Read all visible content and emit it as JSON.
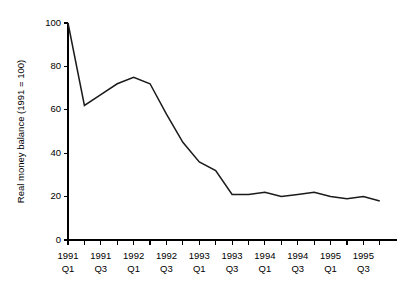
{
  "chart_data": {
    "type": "line",
    "title": "",
    "subtitle": "",
    "xlabel": "",
    "ylabel": "Real money balance (1991 = 100)",
    "ylim": [
      0,
      100
    ],
    "yticks": [
      0,
      20,
      40,
      60,
      80,
      100
    ],
    "ytick_labels": [
      "0",
      "20",
      "40",
      "60",
      "80",
      "100"
    ],
    "grid": false,
    "legend": false,
    "legend_position": "none",
    "line_color": "#1a1a1a",
    "axis_color": "#000000",
    "background_color": "#ffffff",
    "x_minor_ticks_every": 1,
    "x_label_every": 2,
    "categories": [
      "1991 Q1",
      "1991 Q2",
      "1991 Q3",
      "1991 Q4",
      "1992 Q1",
      "1992 Q2",
      "1992 Q3",
      "1992 Q4",
      "1993 Q1",
      "1993 Q2",
      "1993 Q3",
      "1993 Q4",
      "1994 Q1",
      "1994 Q2",
      "1994 Q3",
      "1994 Q4",
      "1995 Q1",
      "1995 Q2",
      "1995 Q3",
      "1995 Q4"
    ],
    "xtick_labels": [
      "1991\nQ1",
      "",
      "1991\nQ3",
      "",
      "1992\nQ1",
      "",
      "1992\nQ3",
      "",
      "1993\nQ1",
      "",
      "1993\nQ3",
      "",
      "1994\nQ1",
      "",
      "1994\nQ3",
      "",
      "1995\nQ1",
      "",
      "1995\nQ3",
      ""
    ],
    "xtick_labels_visible": [
      {
        "index": 0,
        "year": "1991",
        "quarter": "Q1"
      },
      {
        "index": 2,
        "year": "1991",
        "quarter": "Q3"
      },
      {
        "index": 4,
        "year": "1992",
        "quarter": "Q1"
      },
      {
        "index": 6,
        "year": "1992",
        "quarter": "Q3"
      },
      {
        "index": 8,
        "year": "1993",
        "quarter": "Q1"
      },
      {
        "index": 10,
        "year": "1993",
        "quarter": "Q3"
      },
      {
        "index": 12,
        "year": "1994",
        "quarter": "Q1"
      },
      {
        "index": 14,
        "year": "1994",
        "quarter": "Q3"
      },
      {
        "index": 16,
        "year": "1995",
        "quarter": "Q1"
      },
      {
        "index": 18,
        "year": "1995",
        "quarter": "Q3"
      }
    ],
    "values": [
      100,
      62,
      67,
      72,
      75,
      72,
      58,
      45,
      36,
      32,
      21,
      21,
      22,
      20,
      21,
      22,
      20,
      19,
      20,
      18
    ],
    "series": [
      {
        "name": "Real money balance",
        "values": [
          100,
          62,
          67,
          72,
          75,
          72,
          58,
          45,
          36,
          32,
          21,
          21,
          22,
          20,
          21,
          22,
          20,
          19,
          20,
          18
        ]
      }
    ]
  }
}
